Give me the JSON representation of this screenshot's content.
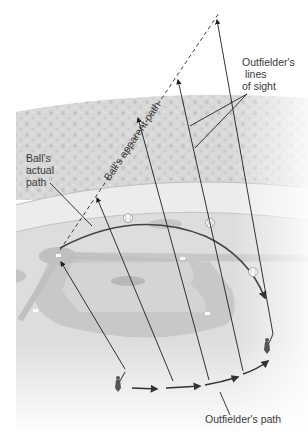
{
  "figure": {
    "labels": {
      "lines_of_sight": "Outfielder's\n lines\nof sight",
      "actual_path": "Ball's\nactual\npath",
      "apparent_path": "Ball's apparent path",
      "outfielder_path": "Outfielder's path"
    },
    "colors": {
      "sky": "#ffffff",
      "stands": "#d6d6d6",
      "stands_dots": "#c2c2c2",
      "warning_track": "#ebebeb",
      "outfield": "#dedede",
      "infield_dirt": "#c9c9c9",
      "infield_grass": "#d3d3d3",
      "mound": "#b9b9b9",
      "line": "#2a2a2a",
      "path_curve": "#444444"
    }
  }
}
